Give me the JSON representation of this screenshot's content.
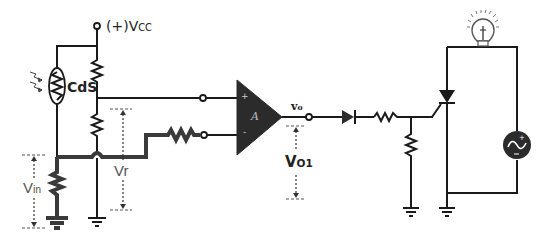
{
  "diagram": {
    "type": "circuit-schematic",
    "labels": {
      "vcc": "(+)V",
      "vcc_sub": "CC",
      "cds": "CdS",
      "vin": "V",
      "vin_sub": "in",
      "vr": "Vr",
      "opamp_plus": "+",
      "opamp_minus": "-",
      "opamp_gain": "A",
      "vo": "v",
      "vo_sub": "o",
      "vo1": "V",
      "vo1_sub": "O1"
    },
    "components": [
      {
        "id": "vcc-terminal",
        "kind": "supply-terminal"
      },
      {
        "id": "cds-photoresistor",
        "kind": "LDR",
        "label": "CdS"
      },
      {
        "id": "r-divider-top",
        "kind": "resistor"
      },
      {
        "id": "r-divider-bottom",
        "kind": "resistor"
      },
      {
        "id": "r-cds-bottom",
        "kind": "resistor"
      },
      {
        "id": "r-input",
        "kind": "resistor"
      },
      {
        "id": "op-amp",
        "kind": "op-amp",
        "label": "A"
      },
      {
        "id": "diode",
        "kind": "diode"
      },
      {
        "id": "r-gate",
        "kind": "resistor"
      },
      {
        "id": "r-gate-shunt",
        "kind": "resistor"
      },
      {
        "id": "scr",
        "kind": "thyristor"
      },
      {
        "id": "lamp",
        "kind": "light-bulb"
      },
      {
        "id": "ac-source",
        "kind": "ac-voltage-source"
      },
      {
        "id": "ground",
        "kind": "ground",
        "count": 4
      }
    ],
    "colors": {
      "wire": "#1a1a1a",
      "thick_wire": "#3a3a3a",
      "component_fill": "#2b2b2b",
      "background": "#ffffff"
    }
  }
}
